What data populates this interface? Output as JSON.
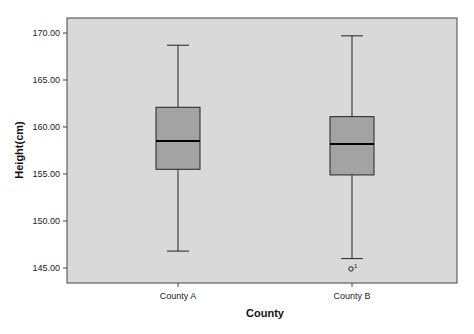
{
  "chart_data": {
    "type": "boxplot",
    "title": "",
    "xlabel": "County",
    "ylabel": "Height(cm)",
    "ylim": [
      144,
      171.5
    ],
    "yticks": [
      145,
      150,
      155,
      160,
      165,
      170
    ],
    "ytick_labels": [
      "145.00",
      "150.00",
      "155.00",
      "160.00",
      "165.00",
      "170.00"
    ],
    "categories": [
      "County A",
      "County B"
    ],
    "grid": false,
    "legend": null,
    "boxes": [
      {
        "name": "County A",
        "whisker_high": 168.7,
        "q3": 162.1,
        "median": 158.5,
        "q1": 155.5,
        "whisker_low": 146.8,
        "outliers": []
      },
      {
        "name": "County B",
        "whisker_high": 169.7,
        "q3": 161.1,
        "median": 158.2,
        "q1": 154.9,
        "whisker_low": 146.0,
        "outliers": [
          {
            "value": 144.9,
            "label": "1"
          }
        ]
      }
    ],
    "colors": {
      "plot_bg": "#d9d9d9",
      "box_fill": "#a3a3a3",
      "line": "#222222"
    }
  }
}
